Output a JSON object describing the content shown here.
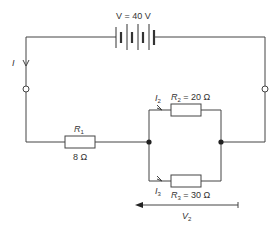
{
  "diagram": {
    "type": "circuit",
    "battery": {
      "label": "V = 40 V",
      "voltage": "40 V"
    },
    "current_total": {
      "label": "I"
    },
    "resistors": [
      {
        "id": "R1",
        "name": "R",
        "sub": "1",
        "value_label": "8 Ω"
      },
      {
        "id": "R2",
        "name": "R",
        "sub": "2",
        "value_label": " = 20 Ω"
      },
      {
        "id": "R3",
        "name": "R",
        "sub": "3",
        "value_label": " = 30 Ω"
      }
    ],
    "branch_currents": [
      {
        "name": "I",
        "sub": "2"
      },
      {
        "name": "I",
        "sub": "3"
      }
    ],
    "voltage_across": {
      "name": "V",
      "sub": "2"
    },
    "colors": {
      "wire": "#444444",
      "text": "#333333",
      "background": "#ffffff"
    }
  }
}
